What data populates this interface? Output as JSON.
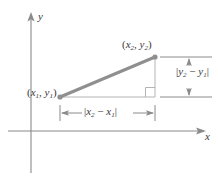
{
  "figure": {
    "axes": {
      "x_label": "x",
      "y_label": "y",
      "origin_px": [
        31,
        131
      ],
      "color": "#8a8a8a"
    },
    "points": [
      {
        "name": "point-1",
        "label": "(x1, y1)",
        "x_sub": "1",
        "y_sub": "1",
        "px": [
          60,
          97
        ]
      },
      {
        "name": "point-2",
        "label": "(x2, y2)",
        "x_sub": "2",
        "y_sub": "2",
        "px": [
          155,
          57
        ]
      }
    ],
    "segment": {
      "name": "hypotenuse",
      "color": "#8f8f8f",
      "width_px": 3,
      "from_px": [
        60,
        97
      ],
      "to_px": [
        155,
        57
      ]
    },
    "legs": {
      "horizontal_color": "#b0b0b0",
      "vertical_color": "#b0b0b0",
      "right_angle_marker": true
    },
    "dimensions": [
      {
        "name": "horizontal-dimension",
        "label": "|x2 - x1|",
        "base": "x",
        "sub_a": "2",
        "sub_b": "1",
        "orientation": "horizontal",
        "from_px": [
          60,
          113
        ],
        "to_px": [
          155,
          113
        ]
      },
      {
        "name": "vertical-dimension",
        "label": "|y2 - y1|",
        "base": "y",
        "sub_a": "2",
        "sub_b": "1",
        "orientation": "vertical",
        "from_px": [
          189,
          57
        ],
        "to_px": [
          189,
          97
        ]
      }
    ],
    "colors": {
      "line": "#8f8f8f",
      "thin_line": "#b0b0b0",
      "axis": "#8a8a8a",
      "text": "#3a3a3a",
      "background": "#ffffff"
    }
  }
}
